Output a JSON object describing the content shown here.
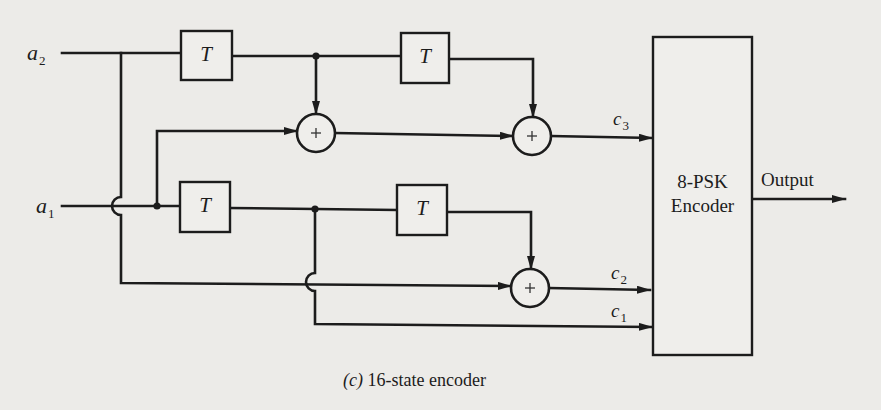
{
  "diagram": {
    "caption": {
      "prefix": "(c)",
      "text": "16-state encoder"
    },
    "inputs": [
      {
        "name": "a",
        "sub": "2"
      },
      {
        "name": "a",
        "sub": "1"
      }
    ],
    "delays": [
      {
        "id": "T1",
        "label": "T"
      },
      {
        "id": "T2",
        "label": "T"
      },
      {
        "id": "T3",
        "label": "T"
      },
      {
        "id": "T4",
        "label": "T"
      }
    ],
    "adders": [
      {
        "id": "add1",
        "symbol": "+"
      },
      {
        "id": "add2",
        "symbol": "+"
      },
      {
        "id": "add3",
        "symbol": "+"
      }
    ],
    "outputs_bits": [
      {
        "name": "c",
        "sub": "3"
      },
      {
        "name": "c",
        "sub": "2"
      },
      {
        "name": "c",
        "sub": "1"
      }
    ],
    "encoder": {
      "line1": "8-PSK",
      "line2": "Encoder"
    },
    "output_label": "Output"
  }
}
